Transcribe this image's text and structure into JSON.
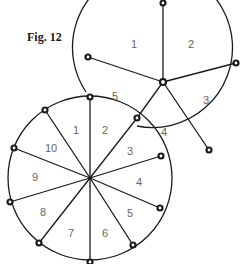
{
  "figure": {
    "label": "Fig. 12"
  },
  "upper_wheel": {
    "segment_labels": [
      "1",
      "2",
      "3",
      "4",
      "5"
    ]
  },
  "lower_wheel": {
    "segment_labels": [
      "1",
      "2",
      "3",
      "4",
      "5",
      "6",
      "7",
      "8",
      "9",
      "10"
    ]
  },
  "colors": {
    "line": "#1a1a1a",
    "label": "#666666",
    "background": "#ffffff"
  }
}
